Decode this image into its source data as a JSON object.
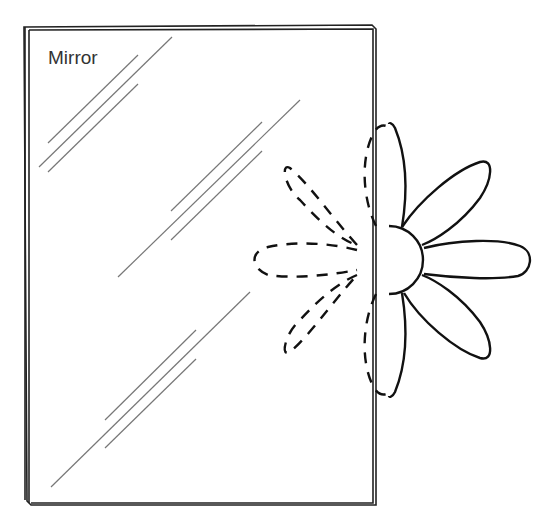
{
  "diagram": {
    "label": "Mirror",
    "colors": {
      "frame": "#222222",
      "shine": "#777777",
      "flower": "#111111"
    },
    "elements": [
      {
        "name": "mirror",
        "type": "rectangle-frame"
      },
      {
        "name": "shine-lines",
        "count": 9
      },
      {
        "name": "real-flower",
        "petals": 5,
        "style": "solid",
        "side": "outside-right"
      },
      {
        "name": "reflected-flower",
        "petals": 5,
        "style": "dashed",
        "side": "inside-mirror"
      }
    ]
  }
}
